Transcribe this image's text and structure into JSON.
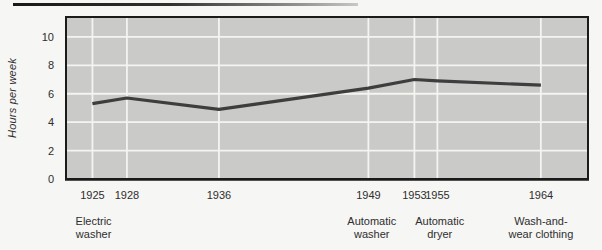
{
  "chart_data": {
    "type": "line",
    "title": "",
    "xlabel": "",
    "ylabel": "Hours per week",
    "x": [
      1925,
      1928,
      1936,
      1949,
      1953,
      1955,
      1964
    ],
    "x_tick_labels": [
      "1925",
      "1928",
      "1936",
      "1949",
      "1953",
      "1955",
      "1964"
    ],
    "values": [
      5.3,
      5.7,
      4.9,
      6.4,
      7.0,
      6.9,
      6.6
    ],
    "series_name": "Hours per week spent on laundry",
    "y_ticks": [
      0,
      2,
      4,
      6,
      8,
      10
    ],
    "ylim": [
      0,
      11.4
    ],
    "xlim": [
      1922.7,
      1968.1
    ],
    "grid": true,
    "legend": "none",
    "annotations": [
      {
        "x_year": 1925.1,
        "lines": [
          "Electric",
          "washer"
        ]
      },
      {
        "x_year": 1949.3,
        "lines": [
          "Automatic",
          "washer"
        ]
      },
      {
        "x_year": 1955.2,
        "lines": [
          "Automatic",
          "dryer"
        ]
      },
      {
        "x_year": 1964.0,
        "lines": [
          "Wash-and-",
          "wear clothing"
        ]
      }
    ],
    "colors": {
      "page_bg": "#f6f6f4",
      "plot_bg": "#cacac8",
      "grid": "#f4f4f2",
      "line": "#3e3e3e",
      "border": "#1b1b1b",
      "text": "#2e2e2e",
      "top_rule_dark": "#191919",
      "top_rule_light": "#c8c8c6"
    }
  }
}
